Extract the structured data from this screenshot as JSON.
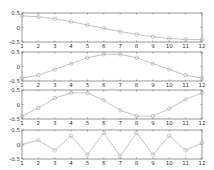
{
  "figure": {
    "background": "#ffffff",
    "axis_color": "#555555",
    "line_color": "#aaaaaa",
    "marker": "circle"
  },
  "chart_data": [
    {
      "type": "line",
      "title": "",
      "xlabel": "",
      "ylabel": "",
      "x": [
        1,
        2,
        3,
        4,
        5,
        6,
        7,
        8,
        9,
        10,
        11,
        12
      ],
      "series": [
        {
          "name": "subplot-1",
          "values": [
            0.4,
            0.37,
            0.3,
            0.2,
            0.09,
            -0.03,
            -0.14,
            -0.24,
            -0.32,
            -0.38,
            -0.41,
            -0.42
          ]
        }
      ],
      "xlim": [
        1,
        12
      ],
      "ylim": [
        -0.5,
        0.5
      ],
      "xticks": [
        "1",
        "2",
        "3",
        "4",
        "5",
        "6",
        "7",
        "8",
        "9",
        "10",
        "11",
        "12"
      ],
      "yticks": [
        "0.5",
        "0",
        "-0.5"
      ],
      "grid": false,
      "legend": null
    },
    {
      "type": "line",
      "title": "",
      "xlabel": "",
      "ylabel": "",
      "x": [
        1,
        2,
        3,
        4,
        5,
        6,
        7,
        8,
        9,
        10,
        11,
        12
      ],
      "series": [
        {
          "name": "subplot-2",
          "values": [
            -0.4,
            -0.3,
            -0.1,
            0.1,
            0.3,
            0.42,
            0.42,
            0.3,
            0.1,
            -0.1,
            -0.3,
            -0.4
          ]
        }
      ],
      "xlim": [
        1,
        12
      ],
      "ylim": [
        -0.5,
        0.5
      ],
      "xticks": [
        "1",
        "2",
        "3",
        "4",
        "5",
        "6",
        "7",
        "8",
        "9",
        "10",
        "11",
        "12"
      ],
      "yticks": [
        "0.5",
        "0",
        "-0.5"
      ],
      "grid": false,
      "legend": null
    },
    {
      "type": "line",
      "title": "",
      "xlabel": "",
      "ylabel": "",
      "x": [
        1,
        2,
        3,
        4,
        5,
        6,
        7,
        8,
        9,
        10,
        11,
        12
      ],
      "series": [
        {
          "name": "subplot-3",
          "values": [
            -0.4,
            -0.12,
            0.22,
            0.4,
            0.4,
            0.15,
            -0.2,
            -0.4,
            -0.4,
            -0.15,
            0.18,
            0.4
          ]
        }
      ],
      "xlim": [
        1,
        12
      ],
      "ylim": [
        -0.5,
        0.5
      ],
      "xticks": [
        "1",
        "2",
        "3",
        "4",
        "5",
        "6",
        "7",
        "8",
        "9",
        "10",
        "11",
        "12"
      ],
      "yticks": [
        "0.5",
        "0",
        "-0.5"
      ],
      "grid": false,
      "legend": null
    },
    {
      "type": "line",
      "title": "",
      "xlabel": "",
      "ylabel": "",
      "x": [
        1,
        2,
        3,
        4,
        5,
        6,
        7,
        8,
        9,
        10,
        11,
        12
      ],
      "series": [
        {
          "name": "subplot-4",
          "values": [
            0.0,
            0.15,
            -0.2,
            0.3,
            -0.35,
            0.4,
            -0.4,
            0.4,
            -0.35,
            0.3,
            -0.2,
            0.05
          ]
        }
      ],
      "xlim": [
        1,
        12
      ],
      "ylim": [
        -0.5,
        0.5
      ],
      "xticks": [
        "1",
        "2",
        "3",
        "4",
        "5",
        "6",
        "7",
        "8",
        "9",
        "10",
        "11",
        "12"
      ],
      "yticks": [
        "0.5",
        "0",
        "-0.5"
      ],
      "grid": false,
      "legend": null
    }
  ]
}
